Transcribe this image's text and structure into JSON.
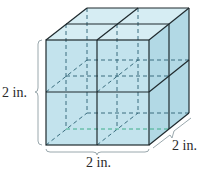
{
  "figure": {
    "type": "cube composed of 8 unit cubes",
    "labels": {
      "height": "2 in.",
      "width": "2 in.",
      "depth": "2 in."
    },
    "colors": {
      "face_fill": "#bfe1ec",
      "top_fill": "#d3ebf2",
      "side_fill": "#aed6e3",
      "edge": "#1f2a2e",
      "hidden_edge": "#3a6d7e",
      "hidden_edge_green": "#3fae8a",
      "brace": "#9aa8ad"
    }
  }
}
